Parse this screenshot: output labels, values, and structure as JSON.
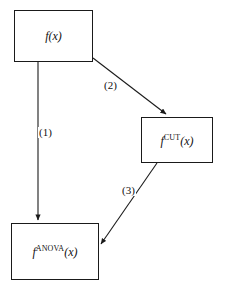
{
  "diagram": {
    "type": "flowchart",
    "background_color": "#ffffff",
    "line_color": "#1a1a1a",
    "text_color": "#111111",
    "nodes": [
      {
        "id": "fx",
        "name": "function-f",
        "base": "f",
        "superscript": "",
        "argument": "(x)",
        "x": 14,
        "y": 10,
        "width": 79,
        "height": 52
      },
      {
        "id": "fcut",
        "name": "function-f-cut",
        "base": "f",
        "superscript": "CUT",
        "argument": "(x)",
        "x": 141,
        "y": 117,
        "width": 72,
        "height": 46
      },
      {
        "id": "fanova",
        "name": "function-f-anova",
        "base": "f",
        "superscript": "ANOVA",
        "argument": "(x)",
        "x": 11,
        "y": 223,
        "width": 88,
        "height": 57
      }
    ],
    "edges": [
      {
        "id": "e1",
        "label": "(1)",
        "from": "fx",
        "to": "fanova",
        "x1": 38,
        "y1": 62,
        "x2": 38,
        "y2": 222
      },
      {
        "id": "e2",
        "label": "(2)",
        "from": "fx",
        "to": "fcut",
        "x1": 93,
        "y1": 58,
        "x2": 167,
        "y2": 116
      },
      {
        "id": "e3",
        "label": "(3)",
        "from": "fcut",
        "to": "fanova",
        "x1": 157,
        "y1": 163,
        "x2": 100,
        "y2": 245
      }
    ]
  }
}
